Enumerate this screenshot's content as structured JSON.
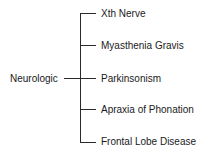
{
  "diagram": {
    "root": "Neurologic",
    "branches": [
      "Xth Nerve",
      "Myasthenia Gravis",
      "Parkinsonism",
      "Apraxia of Phonation",
      "Frontal Lobe Disease"
    ]
  }
}
